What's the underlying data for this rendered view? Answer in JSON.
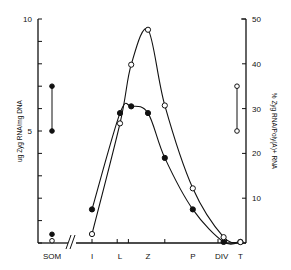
{
  "chart_data": {
    "type": "scatter",
    "title": "",
    "xlabel": "",
    "ylabel_left": "ug Zyg RNA/mg DNA",
    "ylabel_right": "% Zyg RNA/Poly(A)+ RNA",
    "ylim_left": [
      0,
      10
    ],
    "ylim_right": [
      0,
      50
    ],
    "yticks_left_labels": [
      "5",
      "10"
    ],
    "yticks_right_labels": [
      "10",
      "20",
      "30",
      "40",
      "50"
    ],
    "categories": [
      "SOM",
      "I",
      "L",
      "Z",
      "P",
      "DIV",
      "T"
    ],
    "axis_break": "//",
    "grid": false,
    "series": [
      {
        "name": "ug Zyg RNA/mg DNA",
        "marker": "filled-circle",
        "axis": "left",
        "points": [
          {
            "x": "I",
            "pos": 1.0,
            "y": 1.5
          },
          {
            "x": "L",
            "pos": 2.0,
            "y": 5.8
          },
          {
            "x": "L-Z",
            "pos": 2.4,
            "y": 6.1
          },
          {
            "x": "Z",
            "pos": 3.0,
            "y": 5.8
          },
          {
            "x": "Z-P",
            "pos": 3.6,
            "y": 3.8
          },
          {
            "x": "P",
            "pos": 4.6,
            "y": 1.5
          },
          {
            "x": "DIV",
            "pos": 5.7,
            "y": 0.05
          },
          {
            "x": "T",
            "pos": 6.3,
            "y": 0.05
          }
        ],
        "isolated": [
          {
            "x": "SOM",
            "y": 0.3
          }
        ],
        "range_bar": {
          "y_low": 5.0,
          "y_high": 7.0
        }
      },
      {
        "name": "% Zyg RNA/Poly(A)+ RNA",
        "marker": "open-circle",
        "axis": "right",
        "points": [
          {
            "x": "I",
            "pos": 1.0,
            "y": 2.0
          },
          {
            "x": "L",
            "pos": 2.0,
            "y": 26.7
          },
          {
            "x": "L-Z",
            "pos": 2.4,
            "y": 39.8
          },
          {
            "x": "Z",
            "pos": 3.0,
            "y": 47.6
          },
          {
            "x": "Z-P",
            "pos": 3.6,
            "y": 30.7
          },
          {
            "x": "P",
            "pos": 4.6,
            "y": 12.2
          },
          {
            "x": "DIV",
            "pos": 5.7,
            "y": 1.3
          },
          {
            "x": "T",
            "pos": 6.3,
            "y": 0.2
          }
        ],
        "isolated": [
          {
            "x": "SOM",
            "y": 0.5
          }
        ],
        "range_bar": {
          "y_low": 25,
          "y_high": 35
        }
      }
    ]
  }
}
